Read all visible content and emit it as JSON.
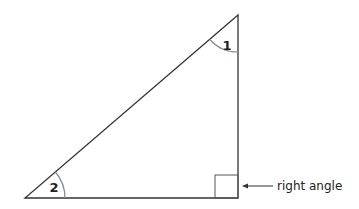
{
  "diagram": {
    "type": "right-triangle",
    "angles": [
      {
        "id": "1",
        "label": "1",
        "position": "top vertex"
      },
      {
        "id": "2",
        "label": "2",
        "position": "bottom-left vertex"
      }
    ],
    "annotation": {
      "label": "right angle",
      "points_to": "bottom-right vertex"
    }
  },
  "colors": {
    "stroke": "#222222",
    "arc": "#888888"
  }
}
